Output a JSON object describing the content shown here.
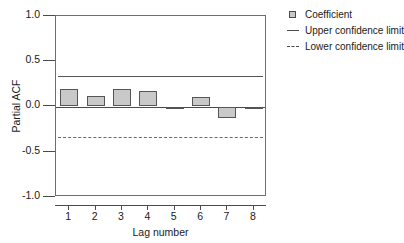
{
  "chart_data": {
    "type": "bar",
    "title": "",
    "xlabel": "Lag number",
    "ylabel": "Partial ACF",
    "categories": [
      "1",
      "2",
      "3",
      "4",
      "5",
      "6",
      "7",
      "8"
    ],
    "values": [
      0.19,
      0.12,
      0.19,
      0.17,
      -0.02,
      0.1,
      -0.13,
      -0.01
    ],
    "series": [
      {
        "name": "Coefficient",
        "values": [
          0.19,
          0.12,
          0.19,
          0.17,
          -0.02,
          0.1,
          -0.13,
          -0.01
        ]
      }
    ],
    "ylim": [
      -1.0,
      1.0
    ],
    "yticks": [
      1.0,
      0.5,
      0.0,
      -0.5,
      -1.0
    ],
    "ytick_labels": [
      "1.0",
      "0.5",
      "0.0",
      "-0.5",
      "-1.0"
    ],
    "xticks": [
      1,
      2,
      3,
      4,
      5,
      6,
      7,
      8
    ],
    "grid": false,
    "legend_position": "top-right",
    "annotations": {
      "upper_confidence_limit": 0.34,
      "lower_confidence_limit": -0.34
    },
    "bar_fill_color": "#c9c9c9",
    "bar_border_color": "#555555"
  },
  "title_remnant": "",
  "legend": {
    "items": [
      {
        "label": "Coefficient",
        "key": "square-swatch-icon"
      },
      {
        "label": "Upper confidence limit",
        "key": "solid-line-icon"
      },
      {
        "label": "Lower confidence limit",
        "key": "dashed-line-icon"
      }
    ]
  }
}
